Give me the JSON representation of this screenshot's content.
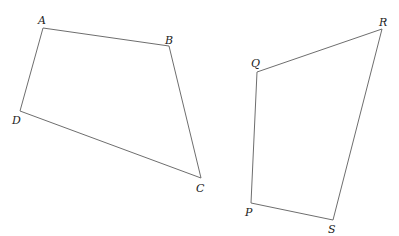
{
  "diagram": {
    "shapes": [
      {
        "name": "quadrilateral-ABCD",
        "vertices": [
          {
            "label": "A",
            "x": 43,
            "y": 28,
            "lx": 38,
            "ly": 24
          },
          {
            "label": "B",
            "x": 169,
            "y": 46,
            "lx": 165,
            "ly": 44
          },
          {
            "label": "C",
            "x": 201,
            "y": 178,
            "lx": 196,
            "ly": 192
          },
          {
            "label": "D",
            "x": 20,
            "y": 111,
            "lx": 12,
            "ly": 124
          }
        ]
      },
      {
        "name": "quadrilateral-PQRS",
        "vertices": [
          {
            "label": "P",
            "x": 251,
            "y": 203,
            "lx": 245,
            "ly": 216
          },
          {
            "label": "Q",
            "x": 257,
            "y": 72,
            "lx": 251,
            "ly": 67
          },
          {
            "label": "R",
            "x": 382,
            "y": 29,
            "lx": 379,
            "ly": 26
          },
          {
            "label": "S",
            "x": 333,
            "y": 220,
            "lx": 328,
            "ly": 233
          }
        ]
      }
    ],
    "line_color": "#6e6e6e",
    "label_color": "#222222"
  }
}
